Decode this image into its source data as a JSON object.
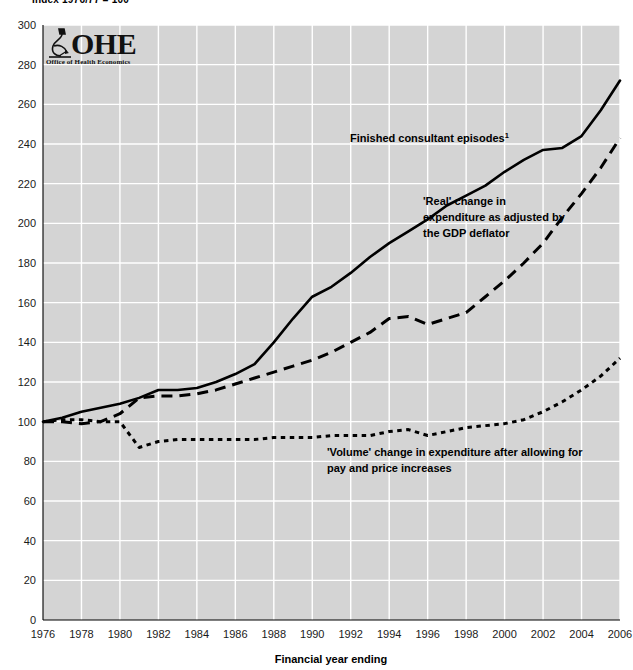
{
  "title": "Index 1976/77 = 100",
  "logo": {
    "mark": "microscope-icon",
    "name": "OHE",
    "subtitle": "Office of Health Economics"
  },
  "axis": {
    "x_title": "Financial year ending",
    "x_ticks": [
      1976,
      1978,
      1980,
      1982,
      1984,
      1986,
      1988,
      1990,
      1992,
      1994,
      1996,
      1998,
      2000,
      2002,
      2004,
      2006
    ],
    "y_ticks": [
      0,
      20,
      40,
      60,
      80,
      100,
      120,
      140,
      160,
      180,
      200,
      220,
      240,
      260,
      280,
      300
    ],
    "xlim": [
      1976,
      2006
    ],
    "ylim": [
      0,
      300
    ]
  },
  "annotations": [
    {
      "id": "annot-fce",
      "text": "Finished consultant episodes",
      "sup": "1",
      "x": 350,
      "y": 142
    },
    {
      "id": "annot-real",
      "lines": [
        "'Real' change in",
        "expenditure as adjusted by",
        "the GDP deflator"
      ],
      "x": 423,
      "y": 205
    },
    {
      "id": "annot-volume",
      "lines": [
        "'Volume' change in expenditure after allowing for",
        "pay and price increases"
      ],
      "x": 327,
      "y": 456
    }
  ],
  "chart_data": {
    "type": "line",
    "title": "Index 1976/77 = 100",
    "xlabel": "Financial year ending",
    "ylabel": "Index 1976/77 = 100",
    "xlim": [
      1976,
      2006
    ],
    "ylim": [
      0,
      300
    ],
    "grid": true,
    "legend": "annotations-inline",
    "x": [
      1976,
      1977,
      1978,
      1979,
      1980,
      1981,
      1982,
      1983,
      1984,
      1985,
      1986,
      1987,
      1988,
      1989,
      1990,
      1991,
      1992,
      1993,
      1994,
      1995,
      1996,
      1997,
      1998,
      1999,
      2000,
      2001,
      2002,
      2003,
      2004,
      2005,
      2006
    ],
    "series": [
      {
        "name": "Finished consultant episodes",
        "style": "solid",
        "note": "1",
        "values": [
          100,
          102,
          105,
          107,
          109,
          112,
          116,
          116,
          117,
          120,
          124,
          129,
          140,
          152,
          163,
          168,
          175,
          183,
          190,
          196,
          202,
          209,
          214,
          219,
          226,
          232,
          237,
          238,
          244,
          257,
          272
        ]
      },
      {
        "name": "'Real' change in expenditure as adjusted by the GDP deflator",
        "style": "dashed",
        "values": [
          100,
          100,
          99,
          100,
          104,
          112,
          113,
          113,
          114,
          116,
          119,
          122,
          125,
          128,
          131,
          135,
          140,
          145,
          152,
          153,
          149,
          152,
          155,
          163,
          171,
          180,
          190,
          203,
          215,
          228,
          243
        ]
      },
      {
        "name": "'Volume' change in expenditure after allowing for pay and price increases",
        "style": "dotted",
        "values": [
          100,
          101,
          101,
          100,
          100,
          87,
          90,
          91,
          91,
          91,
          91,
          91,
          92,
          92,
          92,
          93,
          93,
          93,
          95,
          96,
          93,
          95,
          97,
          98,
          99,
          101,
          105,
          110,
          116,
          123,
          132
        ]
      }
    ]
  }
}
